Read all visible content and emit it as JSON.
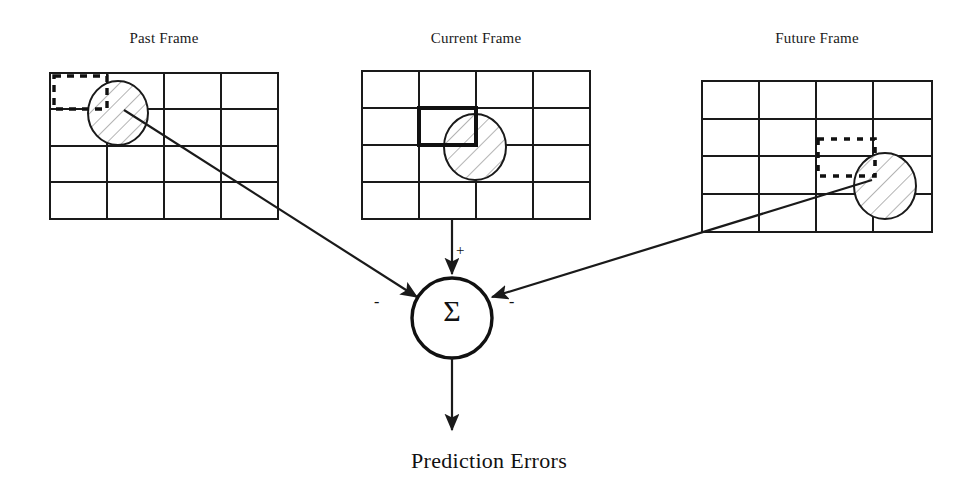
{
  "figure": {
    "type": "diagram",
    "background_color": "#ffffff",
    "line_color": "#1a1a1a"
  },
  "frames": [
    {
      "key": "past",
      "title": "Past Frame",
      "grid": {
        "cols": 4,
        "rows": 4
      },
      "marker_box": {
        "style": "dashed",
        "row": 1,
        "col": 1
      },
      "object": {
        "shape": "ellipse",
        "fill": "hatched",
        "row": 1,
        "col": 2
      },
      "arrow_sign": "-"
    },
    {
      "key": "current",
      "title": "Current Frame",
      "grid": {
        "cols": 4,
        "rows": 4
      },
      "marker_box": {
        "style": "bold-solid",
        "row": 2,
        "col": 2
      },
      "object": {
        "shape": "ellipse",
        "fill": "hatched",
        "row": 2,
        "col": 3
      },
      "arrow_sign": "+"
    },
    {
      "key": "future",
      "title": "Future Frame",
      "grid": {
        "cols": 4,
        "rows": 4
      },
      "marker_box": {
        "style": "dashed",
        "row": 3,
        "col": 4
      },
      "object": {
        "shape": "ellipse",
        "fill": "hatched",
        "row": 3,
        "col": 4
      },
      "arrow_sign": "-"
    }
  ],
  "summation_node": {
    "symbol": "Σ",
    "shape": "circle",
    "input_signs": {
      "from_past": "-",
      "from_current": "+",
      "from_future": "-"
    }
  },
  "output": {
    "label": "Prediction Errors"
  }
}
